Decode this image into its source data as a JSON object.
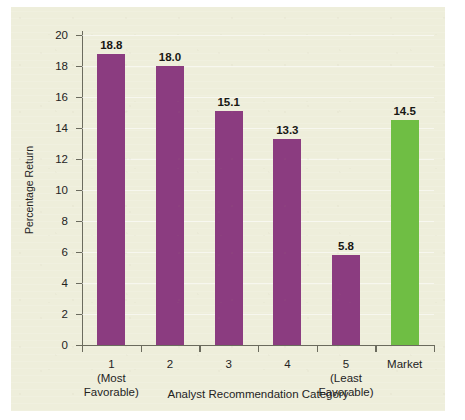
{
  "chart_data": {
    "type": "bar",
    "title": "",
    "xlabel": "Analyst Recommendation Category",
    "ylabel": "Percentage Return",
    "categories": [
      "1",
      "2",
      "3",
      "4",
      "5",
      "Market"
    ],
    "category_sublabels": [
      "(Most Favorable)",
      "",
      "",
      "",
      "(Least Favorable)",
      ""
    ],
    "category_sublabel_lines": [
      [
        "(Most",
        "Favorable)"
      ],
      [],
      [],
      [],
      [
        "(Least",
        "Favorable)"
      ],
      []
    ],
    "values": [
      18.8,
      18.0,
      15.1,
      13.3,
      5.8,
      14.5
    ],
    "value_labels": [
      "18.8",
      "18.0",
      "15.1",
      "13.3",
      "5.8",
      "14.5"
    ],
    "bar_colors": [
      "#8b3c80",
      "#8b3c80",
      "#8b3c80",
      "#8b3c80",
      "#8b3c80",
      "#6fbe44"
    ],
    "ylim": [
      0,
      20
    ],
    "yticks": [
      0,
      2,
      4,
      6,
      8,
      10,
      12,
      14,
      16,
      18,
      20
    ],
    "ytick_labels": [
      "0",
      "2",
      "4",
      "6",
      "8",
      "10",
      "12",
      "14",
      "16",
      "18",
      "20"
    ],
    "grid": true,
    "legend": "none"
  },
  "colors": {
    "panel_background": "#eeeedb",
    "page_background": "#ffffff",
    "axis": "#6b6b5e",
    "text": "#23231e",
    "bar_purple": "#8b3c80",
    "bar_green": "#6fbe44"
  }
}
